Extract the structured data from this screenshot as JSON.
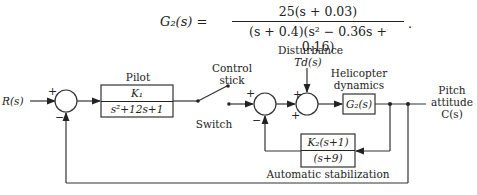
{
  "equation": {
    "lhs": "G₂(s) =",
    "numerator": "25(s + 0.03)",
    "denominator": "(s + 0.4)(s² − 0.36s + 0.16)",
    "trailing": "."
  },
  "diagram": {
    "input_label": "R(s)",
    "summer1": {
      "plus": "+",
      "minus": "−"
    },
    "pilot": {
      "title": "Pilot",
      "numerator": "K₁",
      "denominator": "s²+12s+1"
    },
    "control_stick_label": "Control\nstick",
    "switch_label": "Switch",
    "summer2": {
      "plus": "+",
      "minus": "−"
    },
    "disturbance": {
      "title": "Disturbance",
      "symbol": "T_d(s)",
      "symbol_display": "Td(s)"
    },
    "summer3": {
      "plus_top": "+",
      "plus_left": "+"
    },
    "helicopter": {
      "title": "Helicopter\ndynamics",
      "block": "G₂(s)"
    },
    "output_label": "Pitch\nattitude\nC(s)",
    "stabilization": {
      "numerator": "K₂(s+1)",
      "denominator": "(s+9)",
      "caption": "Automatic stabilization"
    }
  }
}
